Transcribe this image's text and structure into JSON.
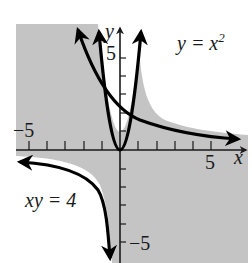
{
  "figure": {
    "axes": {
      "x_label": "x",
      "y_label": "y",
      "x_tick_labels": {
        "neg": "−5",
        "pos": "5"
      },
      "y_tick_labels": {
        "pos": "5",
        "neg": "−5"
      },
      "range": {
        "xmin": -5.6,
        "xmax": 6.9,
        "ymin": -6.2,
        "ymax": 6.9
      }
    },
    "curves": [
      {
        "name": "parabola",
        "label": "y = x",
        "label_sup": "2",
        "equation": "y = x^2"
      },
      {
        "name": "hyperbola",
        "label": "xy = 4",
        "equation": "xy = 4"
      }
    ],
    "colors": {
      "shade": "#c4c4c4",
      "curve": "#000000",
      "axis": "#1a1a1a",
      "background": "#ffffff"
    }
  }
}
